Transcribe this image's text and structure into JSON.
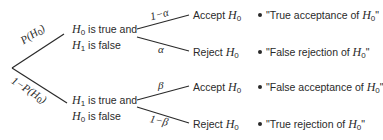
{
  "diagram": {
    "type": "probability-tree",
    "root_edges": [
      {
        "label": "P(H0)",
        "display": "P(H",
        "sub": "0",
        "close": ")"
      },
      {
        "label": "1-P(H0)",
        "display": "1−P(H",
        "sub": "0",
        "close": ")"
      }
    ],
    "nodes": [
      {
        "line1_var": "H",
        "line1_sub": "0",
        "line1_text": " is true and",
        "line2_var": "H",
        "line2_sub": "1",
        "line2_text": " is false",
        "branches": [
          {
            "edge_label": "1−α",
            "decision": "Accept ",
            "decision_var": "H",
            "decision_sub": "0",
            "outcome": "\"True acceptance of ",
            "outcome_var": "H",
            "outcome_sub": "0",
            "outcome_close": "\""
          },
          {
            "edge_label": "α",
            "decision": "Reject ",
            "decision_var": "H",
            "decision_sub": "0",
            "outcome": "\"False rejection of ",
            "outcome_var": "H",
            "outcome_sub": "0",
            "outcome_close": "\""
          }
        ]
      },
      {
        "line1_var": "H",
        "line1_sub": "1",
        "line1_text": " is true and",
        "line2_var": "H",
        "line2_sub": "0",
        "line2_text": " is false",
        "branches": [
          {
            "edge_label": "β",
            "decision": "Accept ",
            "decision_var": "H",
            "decision_sub": "0",
            "outcome": "\"False acceptance of ",
            "outcome_var": "H",
            "outcome_sub": "0",
            "outcome_close": "\""
          },
          {
            "edge_label": "1−β",
            "decision": "Reject ",
            "decision_var": "H",
            "decision_sub": "0",
            "outcome": "\"True rejection of ",
            "outcome_var": "H",
            "outcome_sub": "0",
            "outcome_close": "\""
          }
        ]
      }
    ],
    "line_color": "#2a2a2a"
  }
}
